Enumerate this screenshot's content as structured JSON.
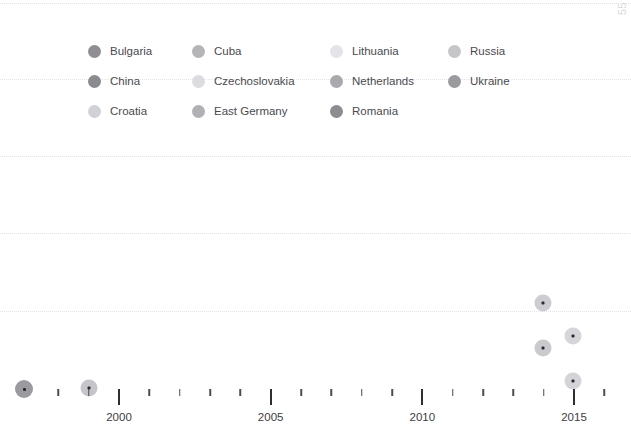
{
  "chart": {
    "corner_label": "55",
    "background_color": "#ffffff",
    "gridline_color": "#e3e3e6"
  },
  "legend": {
    "items": [
      {
        "label": "Bulgaria",
        "color": "#8e8e93",
        "col": 1,
        "row": 1
      },
      {
        "label": "China",
        "color": "#8a8a8f",
        "col": 1,
        "row": 2
      },
      {
        "label": "Croatia",
        "color": "#d2d2d6",
        "col": 1,
        "row": 3
      },
      {
        "label": "Cuba",
        "color": "#b4b4b9",
        "col": 2,
        "row": 1
      },
      {
        "label": "Czechoslovakia",
        "color": "#dcdce0",
        "col": 2,
        "row": 2
      },
      {
        "label": "East Germany",
        "color": "#b0b0b5",
        "col": 2,
        "row": 3
      },
      {
        "label": "Lithuania",
        "color": "#e4e4e8",
        "col": 3,
        "row": 1
      },
      {
        "label": "Netherlands",
        "color": "#a9a9ae",
        "col": 3,
        "row": 2
      },
      {
        "label": "Romania",
        "color": "#8c8c91",
        "col": 3,
        "row": 3
      },
      {
        "label": "Russia",
        "color": "#c6c6ca",
        "col": 4,
        "row": 1
      },
      {
        "label": "Ukraine",
        "color": "#9a9a9f",
        "col": 4,
        "row": 2
      }
    ]
  },
  "chart_data": {
    "type": "scatter",
    "title": "",
    "xlabel": "",
    "ylabel": "",
    "xlim": [
      1997,
      2016.2
    ],
    "ylim": [
      0,
      55
    ],
    "grid": true,
    "legend_position": "top",
    "x_ticks_major": [
      2000,
      2005,
      2010,
      2015
    ],
    "x_tick_labels": [
      "2000",
      "2005",
      "2010",
      "2015"
    ],
    "x_ticks_minor": [
      1998,
      1999,
      2001,
      2002,
      2003,
      2004,
      2006,
      2007,
      2008,
      2009,
      2011,
      2012,
      2013,
      2014,
      2016
    ],
    "y_gridlines_px": [
      3,
      79,
      156,
      233,
      311
    ],
    "points": [
      {
        "label": "Bulgaria",
        "x_px": 24,
        "y_px": 389,
        "radius_px": 9,
        "color": "#9b9b9f"
      },
      {
        "label": "China",
        "x_px": 89,
        "y_px": 388,
        "radius_px": 8.5,
        "color": "#c5c5ca"
      },
      {
        "label": "Romania",
        "x_px": 543,
        "y_px": 303,
        "radius_px": 8.5,
        "color": "#cdcdd1"
      },
      {
        "label": "Netherlands",
        "x_px": 543,
        "y_px": 348,
        "radius_px": 8.5,
        "color": "#c9c9ce"
      },
      {
        "label": "Ukraine",
        "x_px": 573,
        "y_px": 336,
        "radius_px": 8.5,
        "color": "#d6d6da"
      },
      {
        "label": "Russia",
        "x_px": 573,
        "y_px": 381,
        "radius_px": 8.5,
        "color": "#d4d4d8"
      }
    ]
  }
}
